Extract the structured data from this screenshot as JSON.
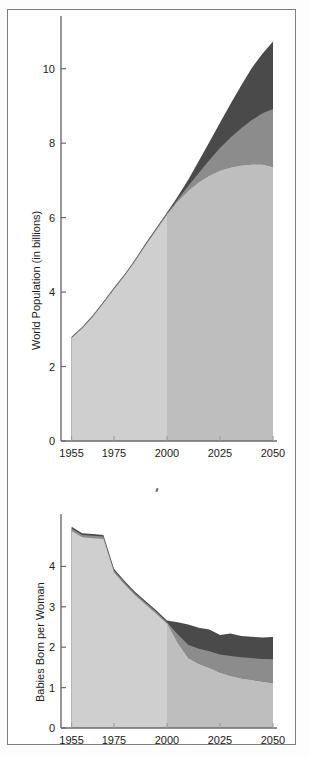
{
  "figure": {
    "background_color": "#ffffff",
    "border_color": "#7e7e7e"
  },
  "colors": {
    "low_band": "#cfcfcf",
    "low_band_projection": "#bebebe",
    "medium_band": "#8c8c8c",
    "high_band": "#4a4a4a",
    "axis": "#6b6b6b",
    "text": "#1a1a1a"
  },
  "chart_data": [
    {
      "id": "world-population",
      "type": "area",
      "title": "",
      "xlabel": "",
      "ylabel": "World Population (in billions)",
      "xlim": [
        1950,
        2050
      ],
      "ylim": [
        0,
        11.2
      ],
      "xticks": [
        1955,
        1975,
        2000,
        2025,
        2050
      ],
      "xtick_labels": [
        "1955",
        "1975",
        "2000",
        "2025",
        "2050"
      ],
      "yticks": [
        0,
        2,
        4,
        6,
        8,
        10
      ],
      "ytick_labels": [
        "0",
        "2",
        "4",
        "6",
        "8",
        "10"
      ],
      "grid": false,
      "legend": "none",
      "projection_start": 2000,
      "x": [
        1955,
        1960,
        1965,
        1970,
        1975,
        1980,
        1985,
        1990,
        1995,
        2000,
        2005,
        2010,
        2015,
        2020,
        2025,
        2030,
        2035,
        2040,
        2045,
        2050
      ],
      "series": [
        {
          "name": "low",
          "values": [
            2.76,
            3.02,
            3.33,
            3.69,
            4.07,
            4.43,
            4.83,
            5.26,
            5.67,
            6.07,
            6.42,
            6.71,
            6.94,
            7.12,
            7.25,
            7.34,
            7.39,
            7.42,
            7.42,
            7.35
          ]
        },
        {
          "name": "medium",
          "values": [
            2.78,
            3.04,
            3.36,
            3.72,
            4.1,
            4.46,
            4.86,
            5.29,
            5.7,
            6.11,
            6.48,
            6.85,
            7.2,
            7.55,
            7.87,
            8.15,
            8.4,
            8.62,
            8.8,
            8.92
          ]
        },
        {
          "name": "high",
          "values": [
            2.8,
            3.06,
            3.38,
            3.74,
            4.12,
            4.48,
            4.88,
            5.32,
            5.73,
            6.14,
            6.56,
            7.02,
            7.52,
            8.03,
            8.55,
            9.06,
            9.55,
            10.02,
            10.4,
            10.73
          ]
        }
      ]
    },
    {
      "id": "babies-born-per-woman",
      "type": "area",
      "title": "",
      "xlabel": "",
      "ylabel": "Babies Born per Woman",
      "xlim": [
        1950,
        2050
      ],
      "ylim": [
        0,
        5.1
      ],
      "xticks": [
        1955,
        1975,
        2000,
        2025,
        2050
      ],
      "xtick_labels": [
        "1955",
        "1975",
        "2000",
        "2025",
        "2050"
      ],
      "yticks": [
        0,
        1,
        2,
        3,
        4
      ],
      "ytick_labels": [
        "0",
        "1",
        "2",
        "3",
        "4"
      ],
      "grid": false,
      "legend": "none",
      "projection_start": 2000,
      "x": [
        1955,
        1960,
        1965,
        1970,
        1975,
        1980,
        1985,
        1990,
        1995,
        2000,
        2005,
        2010,
        2015,
        2020,
        2025,
        2030,
        2035,
        2040,
        2045,
        2050
      ],
      "series": [
        {
          "name": "low",
          "values": [
            4.88,
            4.72,
            4.7,
            4.68,
            3.85,
            3.55,
            3.28,
            3.05,
            2.82,
            2.58,
            2.1,
            1.72,
            1.58,
            1.48,
            1.36,
            1.28,
            1.22,
            1.18,
            1.14,
            1.1
          ]
        },
        {
          "name": "medium",
          "values": [
            4.94,
            4.78,
            4.76,
            4.74,
            3.9,
            3.6,
            3.33,
            3.1,
            2.87,
            2.62,
            2.32,
            2.06,
            1.96,
            1.9,
            1.82,
            1.78,
            1.75,
            1.73,
            1.71,
            1.7
          ]
        },
        {
          "name": "high",
          "values": [
            4.98,
            4.82,
            4.8,
            4.78,
            3.94,
            3.64,
            3.37,
            3.14,
            2.91,
            2.66,
            2.62,
            2.56,
            2.48,
            2.44,
            2.3,
            2.34,
            2.28,
            2.26,
            2.24,
            2.25
          ]
        }
      ]
    }
  ]
}
